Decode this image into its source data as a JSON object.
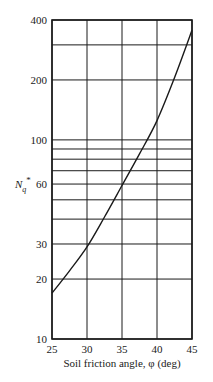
{
  "chart_data": {
    "type": "line",
    "title": "",
    "xlabel": "Soil friction angle, φ (deg)",
    "ylabel": "N_q*",
    "ylabel_main": "N",
    "ylabel_sub": "q",
    "ylabel_sup": "*",
    "yscale": "log",
    "xlim": [
      25,
      45
    ],
    "ylim": [
      10,
      400
    ],
    "grid": true,
    "legend": null,
    "x_ticks": [
      25,
      30,
      35,
      40,
      45
    ],
    "y_tick_labels": [
      10,
      20,
      30,
      60,
      100,
      200,
      400
    ],
    "y_gridlines": [
      10,
      20,
      30,
      40,
      50,
      60,
      70,
      80,
      90,
      100,
      200,
      300,
      400
    ],
    "series": [
      {
        "name": "N_q*",
        "x": [
          25,
          27.5,
          30,
          32.5,
          35,
          37.5,
          40,
          42.5,
          45
        ],
        "values": [
          17,
          22,
          29,
          41,
          59,
          85,
          125,
          205,
          355
        ]
      }
    ]
  }
}
